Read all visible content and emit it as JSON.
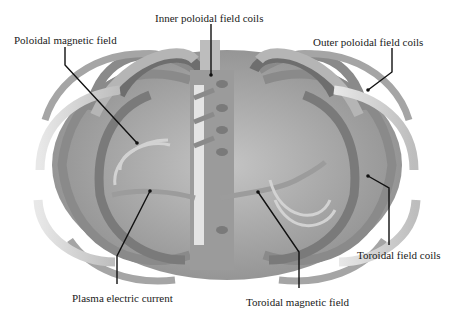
{
  "diagram": {
    "labels": {
      "inner_poloidal_field_coils": "Inner poloidal field coils",
      "poloidal_magnetic_field": "Poloidal magnetic field",
      "outer_poloidal_field_coils": "Outer poloidal field coils",
      "toroidal_field_coils": "Toroidal field coils",
      "plasma_electric_current": "Plasma electric current",
      "toroidal_magnetic_field": "Toroidal magnetic field"
    },
    "colors": {
      "background": "#ffffff",
      "coil_light": "#c9c9c9",
      "coil_mid": "#9a9a9a",
      "coil_dark": "#6e6e6e",
      "coil_highlight": "#e6e6e6",
      "leader_line": "#111111",
      "text": "#1a1a1a"
    }
  }
}
